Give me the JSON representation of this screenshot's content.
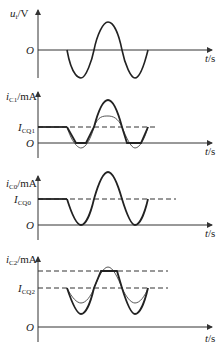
{
  "panels": [
    {
      "id": "ui",
      "y_label": "u_i/V",
      "y_label_main": "u",
      "y_label_sub": "i",
      "y_label_unit": "/V",
      "origin": "O",
      "x_label": "t/s",
      "description": "Input sinusoid: starts at zero, dips negative, peaks positive, dips negative, returns to zero"
    },
    {
      "id": "iC1",
      "y_label_main": "i",
      "y_label_sub": "C1",
      "y_label_unit": "/mA",
      "q_label_main": "I",
      "q_label_sub": "CQ1",
      "origin": "O",
      "x_label": "t/s",
      "description": "Bold clipped-bottom waveform with thin undistorted sine; dashed line at I_CQ1"
    },
    {
      "id": "iC0",
      "y_label_main": "i",
      "y_label_sub": "C0",
      "y_label_unit": "/mA",
      "q_label_main": "I",
      "q_label_sub": "CQ0",
      "origin": "O",
      "x_label": "t/s",
      "description": "Full sine around I_CQ0 just touching zero at troughs; dashed line at I_CQ0"
    },
    {
      "id": "iC2",
      "y_label_main": "i",
      "y_label_sub": "C2",
      "y_label_unit": "/mA",
      "q_label_main": "I",
      "q_label_sub": "CQ2",
      "origin": "O",
      "x_label": "t/s",
      "description": "Bold waveform clipped flat at top (saturation dashed line), thin undistorted sine; dashed line at I_CQ2"
    }
  ]
}
